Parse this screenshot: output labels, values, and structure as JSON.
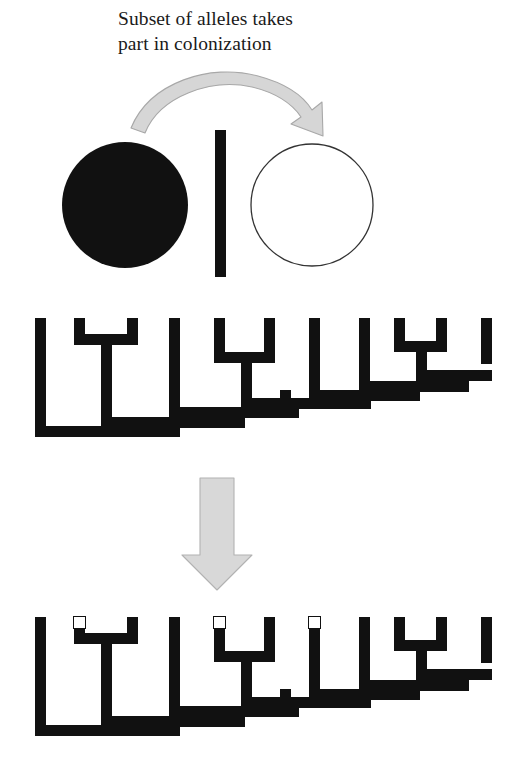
{
  "figure": {
    "caption": "Subset of alleles takes\npart in colonization",
    "colors": {
      "ink": "#111111",
      "arrow_fill": "#d6d6d6",
      "arrow_stroke": "#9a9a9a",
      "circle_outline": "#333333",
      "background": "#ffffff",
      "empty_marker_fill": "#ffffff"
    },
    "source_population": {
      "label": "source-population-circle",
      "state": "filled",
      "cx": 125,
      "cy": 205,
      "r": 63
    },
    "divider_bar": {
      "label": "vertical-divider-bar",
      "x": 215,
      "y": 130,
      "width": 11,
      "height": 147
    },
    "founder_population": {
      "label": "founder-population-circle",
      "state": "empty",
      "cx": 312,
      "cy": 205,
      "r": 61
    },
    "curved_arrow": {
      "label": "colonization-arrow",
      "direction": "left-to-right-arc"
    },
    "down_arrow": {
      "label": "transition-arrow",
      "direction": "down"
    }
  },
  "trees": [
    {
      "name": "source-tree",
      "y_top": 318,
      "tip_markers": [],
      "marker_count": 0
    },
    {
      "name": "founder-tree",
      "y_top": 617,
      "tip_markers": [
        2,
        4,
        6
      ],
      "marker_count": 3
    }
  ],
  "tree_geometry": {
    "stroke": 11,
    "tips_x": [
      40,
      79,
      132,
      174,
      219,
      269,
      314,
      364,
      399,
      441,
      486
    ],
    "tip_count": 11,
    "node_levels_offset": [
      22,
      40,
      50,
      60,
      72,
      85,
      95,
      105,
      114
    ],
    "description": "pectinate ladder cladogram, thick black right-angle branches"
  }
}
